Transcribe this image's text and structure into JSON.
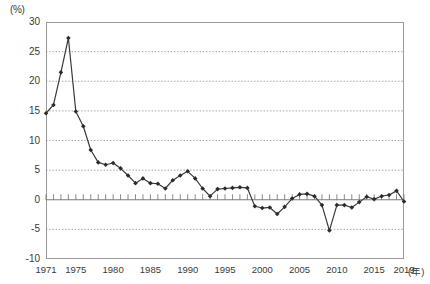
{
  "chart_data": {
    "type": "line",
    "title": "",
    "subtitle": "",
    "xlabel": "年",
    "ylabel": "(%)",
    "unit_label": "(%)",
    "year_suffix": "(年)",
    "xlim": [
      1971,
      2019
    ],
    "ylim": [
      -10,
      30
    ],
    "yticks": [
      30,
      25,
      20,
      15,
      10,
      5,
      0,
      -5,
      -10
    ],
    "ytick_labels": [
      "30",
      "25",
      "20",
      "15",
      "10",
      "5",
      "0",
      "-5",
      "-10"
    ],
    "xticks": [
      1971,
      1975,
      1980,
      1985,
      1990,
      1995,
      2000,
      2005,
      2010,
      2015,
      2019
    ],
    "xtick_labels": [
      "1971",
      "1975",
      "1980",
      "1985",
      "1990",
      "1995",
      "2000",
      "2005",
      "2010",
      "2015",
      "2019"
    ],
    "grid": "horizontal-dotted",
    "legend": "none",
    "marker": "diamond",
    "line_color": "#3a3a3a",
    "marker_color": "#2b2b2b",
    "grid_color": "#888888",
    "axis_color": "#9a9a9a",
    "x": [
      1971,
      1972,
      1973,
      1974,
      1975,
      1976,
      1977,
      1978,
      1979,
      1980,
      1981,
      1982,
      1983,
      1984,
      1985,
      1986,
      1987,
      1988,
      1989,
      1990,
      1991,
      1992,
      1993,
      1994,
      1995,
      1996,
      1997,
      1998,
      1999,
      2000,
      2001,
      2002,
      2003,
      2004,
      2005,
      2006,
      2007,
      2008,
      2009,
      2010,
      2011,
      2012,
      2013,
      2014,
      2015,
      2016,
      2017,
      2018,
      2019
    ],
    "values": [
      14.6,
      16.0,
      21.5,
      27.3,
      14.9,
      12.4,
      8.4,
      6.3,
      5.9,
      6.2,
      5.3,
      4.1,
      2.8,
      3.6,
      2.8,
      2.7,
      1.9,
      3.3,
      4.1,
      4.8,
      3.6,
      1.9,
      0.6,
      1.8,
      1.9,
      2.0,
      2.1,
      2.0,
      -1.1,
      -1.4,
      -1.3,
      -2.4,
      -1.2,
      0.2,
      0.9,
      1.0,
      0.6,
      -0.9,
      -5.2,
      -0.9,
      -0.9,
      -1.3,
      -0.4,
      0.5,
      0.1,
      0.6,
      0.8,
      1.5,
      -0.3
    ],
    "series_name": "地価変動率"
  }
}
